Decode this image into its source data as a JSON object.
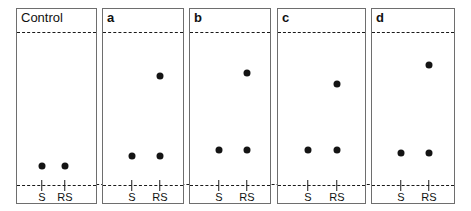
{
  "figure": {
    "type": "tlc-chromatogram-plate-series",
    "width": 471,
    "height": 211,
    "panel_count": 5,
    "colors": {
      "spot": "#141414",
      "line": "#1a1a1a",
      "border": "#6e6e6e",
      "background": "#ffffff"
    },
    "lane_labels": [
      "S",
      "RS"
    ],
    "solvent_front_y": 31,
    "origin_baseline_y": 184
  },
  "panels": [
    {
      "label": "Control",
      "label_bold": false,
      "x": 16,
      "y": 8,
      "width": 81,
      "height": 196,
      "lanes": [
        {
          "name": "S",
          "cx": 41
        },
        {
          "name": "RS",
          "cx": 64
        }
      ],
      "spots": [
        {
          "lane": "S",
          "cx": 41,
          "cy": 165
        },
        {
          "lane": "RS",
          "cx": 64,
          "cy": 165
        }
      ]
    },
    {
      "label": "a",
      "label_bold": true,
      "x": 102,
      "y": 8,
      "width": 82,
      "height": 196,
      "lanes": [
        {
          "name": "S",
          "cx": 131
        },
        {
          "name": "RS",
          "cx": 159
        }
      ],
      "spots": [
        {
          "lane": "RS",
          "cx": 159,
          "cy": 75
        },
        {
          "lane": "S",
          "cx": 131,
          "cy": 155
        },
        {
          "lane": "RS",
          "cx": 159,
          "cy": 155
        }
      ]
    },
    {
      "label": "b",
      "label_bold": true,
      "x": 189,
      "y": 8,
      "width": 82,
      "height": 196,
      "lanes": [
        {
          "name": "S",
          "cx": 218
        },
        {
          "name": "RS",
          "cx": 246
        }
      ],
      "spots": [
        {
          "lane": "RS",
          "cx": 246,
          "cy": 72
        },
        {
          "lane": "S",
          "cx": 218,
          "cy": 149
        },
        {
          "lane": "RS",
          "cx": 246,
          "cy": 149
        }
      ]
    },
    {
      "label": "c",
      "label_bold": true,
      "x": 277,
      "y": 8,
      "width": 89,
      "height": 196,
      "lanes": [
        {
          "name": "S",
          "cx": 307
        },
        {
          "name": "RS",
          "cx": 336
        }
      ],
      "spots": [
        {
          "lane": "RS",
          "cx": 336,
          "cy": 83
        },
        {
          "lane": "S",
          "cx": 307,
          "cy": 149
        },
        {
          "lane": "RS",
          "cx": 336,
          "cy": 149
        }
      ]
    },
    {
      "label": "d",
      "label_bold": true,
      "x": 371,
      "y": 8,
      "width": 84,
      "height": 196,
      "lanes": [
        {
          "name": "S",
          "cx": 400
        },
        {
          "name": "RS",
          "cx": 428
        }
      ],
      "spots": [
        {
          "lane": "RS",
          "cx": 428,
          "cy": 64
        },
        {
          "lane": "S",
          "cx": 400,
          "cy": 152
        },
        {
          "lane": "RS",
          "cx": 428,
          "cy": 152
        }
      ]
    }
  ],
  "chart_data": {
    "type": "scatter",
    "title": "",
    "xlabel": "",
    "ylabel": "",
    "categories": [
      "Control",
      "a",
      "b",
      "c",
      "d"
    ],
    "lanes": [
      "S",
      "RS"
    ],
    "axis_reference": {
      "origin_baseline": 0,
      "solvent_front": 1
    },
    "series": [
      {
        "name": "S",
        "values": [
          0.124,
          0.19,
          0.229,
          0.229,
          0.209
        ],
        "spot_counts": [
          1,
          1,
          1,
          1,
          1
        ]
      },
      {
        "name": "RS",
        "values": [
          0.124,
          0.19,
          0.229,
          0.229,
          0.209
        ],
        "spot_counts": [
          1,
          2,
          2,
          2,
          2
        ]
      },
      {
        "name": "RS-upper",
        "values": [
          null,
          0.712,
          0.732,
          0.66,
          0.784
        ],
        "spot_counts": [
          0,
          1,
          1,
          1,
          1
        ]
      }
    ],
    "legend_position": "none",
    "grid": false
  }
}
